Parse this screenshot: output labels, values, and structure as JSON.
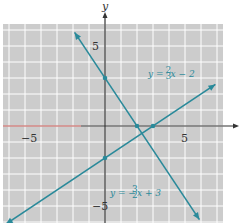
{
  "chart_data": {
    "type": "line",
    "title": "",
    "xlabel": "x",
    "ylabel": "y",
    "xlim": [
      -6,
      7
    ],
    "ylim": [
      -6,
      6
    ],
    "grid": true,
    "x_ticks": [
      {
        "value": -5,
        "label": "−5"
      },
      {
        "value": 5,
        "label": "5"
      }
    ],
    "y_ticks": [
      {
        "value": 5,
        "label": "5"
      },
      {
        "value": -5,
        "label": "−5"
      }
    ],
    "series": [
      {
        "name": "y = (2/3)x − 2",
        "label_parts": {
          "lhs": "y = ",
          "num": "2",
          "den": "3",
          "rhs": "x − 2"
        },
        "slope": 0.6667,
        "intercept": -2,
        "x_range": [
          -6.2,
          6.9
        ],
        "points": [
          {
            "x": 0,
            "y": -2
          },
          {
            "x": 3,
            "y": 0
          }
        ],
        "label_position": "upper-right"
      },
      {
        "name": "y = −(3/2)x + 3",
        "label_parts": {
          "lhs": "y = −",
          "num": "3",
          "den": "2",
          "rhs": "x + 3"
        },
        "slope": -1.5,
        "intercept": 3,
        "x_range": [
          -1.9,
          5.9
        ],
        "points": [
          {
            "x": 0,
            "y": 3
          },
          {
            "x": 2,
            "y": 0
          }
        ],
        "label_position": "lower-center"
      }
    ],
    "intersection": {
      "x": 2.31,
      "y": -0.46
    }
  },
  "colors": {
    "grid_bg": "#cccccc",
    "grid_line": "#ffffff",
    "axis": "#333333",
    "line": "#2a8a9a",
    "neg_x_axis_tint": "#c0504d"
  }
}
